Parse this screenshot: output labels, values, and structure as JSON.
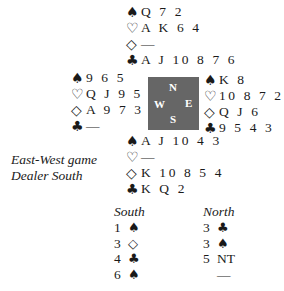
{
  "symbols": {
    "spade": "♠",
    "heart": "♡",
    "diamond": "◇",
    "club": "♣"
  },
  "hands": {
    "north": {
      "spades": "Q 7 2",
      "hearts": "A K 6 4",
      "diamonds": "—",
      "clubs": "A J 10 8 7 6"
    },
    "west": {
      "spades": "9 6 5",
      "hearts": "Q J 9 5 3",
      "diamonds": "A 9 7 3 2",
      "clubs": "—"
    },
    "east": {
      "spades": "K 8",
      "hearts": "10 8 7 2",
      "diamonds": "Q J 6",
      "clubs": "9 5 4 3"
    },
    "south": {
      "spades": "A J 10 4 3",
      "hearts": "—",
      "diamonds": "K 10 8 5 4",
      "clubs": "K Q 2"
    }
  },
  "compass": {
    "n": "N",
    "w": "W",
    "e": "E",
    "s": "S",
    "color": "#666666"
  },
  "info": {
    "vulnerability": "East-West game",
    "dealer": "Dealer South"
  },
  "auction": {
    "south": {
      "header": "South",
      "bids": [
        {
          "level": "1",
          "strain": "♠"
        },
        {
          "level": "3",
          "strain": "◇"
        },
        {
          "level": "4",
          "strain": "♣"
        },
        {
          "level": "6",
          "strain": "♠"
        }
      ]
    },
    "north": {
      "header": "North",
      "bids": [
        {
          "level": "3",
          "strain": "♣"
        },
        {
          "level": "3",
          "strain": "♠"
        },
        {
          "level": "5",
          "strain": "NT"
        },
        {
          "level": "—",
          "strain": ""
        }
      ]
    }
  }
}
